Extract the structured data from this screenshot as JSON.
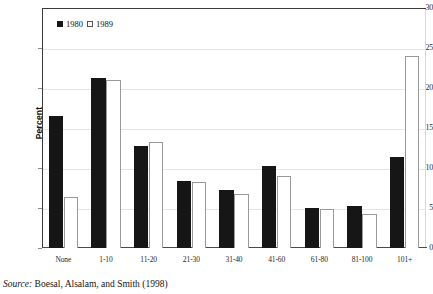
{
  "chart_data": {
    "type": "bar",
    "title": "",
    "subtitle": "",
    "xlabel": "",
    "ylabel": "Percent",
    "ylim": [
      0,
      30
    ],
    "yticks": [
      0,
      5,
      10,
      15,
      20,
      25,
      30
    ],
    "ytick_labels": [
      "0",
      "5",
      "10",
      "15",
      "20",
      "25",
      "30"
    ],
    "grid": true,
    "legend_position": "top-left-inside",
    "categories": [
      "None",
      "1-10",
      "11-20",
      "21-30",
      "31-40",
      "41-60",
      "61-80",
      "81-100",
      "101+"
    ],
    "series": [
      {
        "name": "1980",
        "style": "filled-black",
        "color": "#161616",
        "values": [
          16.5,
          21.3,
          12.8,
          8.4,
          7.2,
          10.2,
          5.0,
          5.2,
          11.4
        ]
      },
      {
        "name": "1989",
        "style": "open-white",
        "color": "#ffffff",
        "border_color": "#9a9a9a",
        "values": [
          6.4,
          21.0,
          13.2,
          8.3,
          6.8,
          9.0,
          4.9,
          4.3,
          24.0
        ]
      }
    ]
  },
  "legend": {
    "entries": [
      {
        "label": "1980",
        "swatch": "filled-square-swatch"
      },
      {
        "label": "1989",
        "swatch": "open-square-swatch"
      }
    ]
  },
  "source": {
    "prefix": "Source:",
    "text": " Boesal, Alsalam, and Smith (1998)"
  },
  "colors": {
    "bar_1980": "#161616",
    "bar_1989_fill": "#ffffff",
    "bar_1989_stroke": "#9a9a9a",
    "axis": "#3a3a3a",
    "gridline": "#e4e4e4",
    "text": "#141414",
    "background": "#ffffff"
  }
}
